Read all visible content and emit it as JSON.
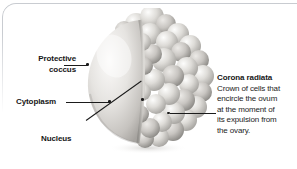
{
  "figure": {
    "alt": "Illustration of a human ovum showing a smooth protective coccus hemisphere and a bumpy crown of corona radiata cells"
  },
  "labels": {
    "protective_coccus": {
      "line1": "Protective",
      "line2": "coccus"
    },
    "cytoplasm": "Cytoplasm",
    "nucleus": "Nucleus"
  },
  "corona": {
    "heading": "Corona radiata",
    "body_lines": [
      "Crown of cells that",
      "encircle the ovum",
      "at the moment of",
      "its expulsion from",
      "the ovary."
    ]
  },
  "colors": {
    "text": "#161616",
    "leader": "#1b1b1b",
    "frame": "#c9ccd1",
    "cell_light": "#f3f2f0",
    "cell_mid": "#cfcdc9",
    "cell_shadow": "#9b9995",
    "background": "#ffffff"
  }
}
